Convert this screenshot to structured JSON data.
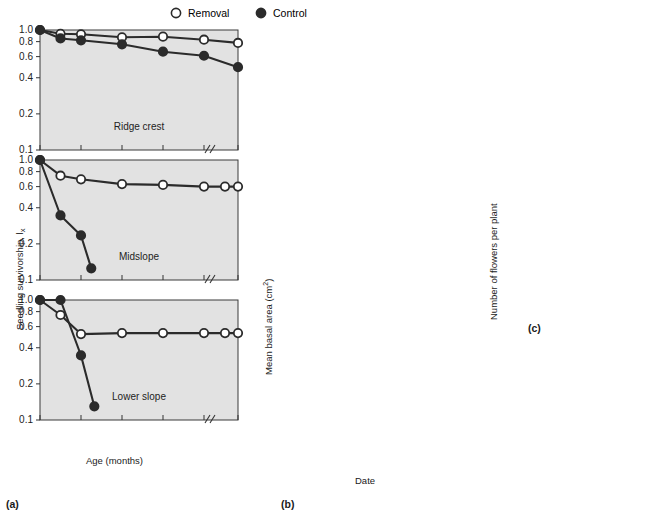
{
  "figure": {
    "legend": [
      {
        "symbol": "open-circle",
        "label": "Removal"
      },
      {
        "symbol": "filled-circle",
        "label": "Control"
      }
    ],
    "captions": {
      "a": "(a)",
      "b": "(b)",
      "c": "(c)"
    },
    "colors": {
      "panel_bg": "#e2e2e2",
      "line": "#2b2b2b",
      "open_fill": "#ffffff",
      "closed_fill": "#2b2b2b"
    }
  },
  "chart_data": [
    {
      "id": "a-ridge-crest",
      "type": "line",
      "title": "Ridge crest",
      "xlabel": "Age (months)",
      "ylabel": "Seedling survivorship, lx",
      "yscale": "log",
      "ylim": [
        0.1,
        1.0
      ],
      "yticks": [
        1.0,
        0.8,
        0.6,
        0.4,
        0.2,
        0.1
      ],
      "ytick_labels": [
        "1.0",
        "0.8",
        "0.6",
        "0.4",
        "0.2",
        "0.1"
      ],
      "xticks": [
        0,
        4,
        8,
        12,
        16,
        24
      ],
      "xtick_labels": [
        "0",
        "4",
        "8",
        "12",
        "16",
        "24"
      ],
      "x_axis_break_between": [
        16,
        24
      ],
      "secondary_xtick_labels": [
        "May 80",
        "Sep",
        "Jan 81",
        "May",
        "Sep",
        "May 82"
      ],
      "series": [
        {
          "name": "Removal",
          "symbol": "open-circle",
          "x": [
            0,
            2,
            4,
            8,
            12,
            16,
            24
          ],
          "values": [
            1.0,
            0.93,
            0.92,
            0.87,
            0.88,
            0.83,
            0.78
          ]
        },
        {
          "name": "Control",
          "symbol": "filled-circle",
          "x": [
            0,
            2,
            4,
            8,
            12,
            16,
            24
          ],
          "values": [
            1.0,
            0.85,
            0.82,
            0.76,
            0.66,
            0.61,
            0.49
          ]
        }
      ]
    },
    {
      "id": "a-midslope",
      "type": "line",
      "title": "Midslope",
      "yscale": "log",
      "ylim": [
        0.1,
        1.0
      ],
      "yticks": [
        1.0,
        0.8,
        0.6,
        0.4,
        0.2,
        0.1
      ],
      "ytick_labels": [
        "1.0",
        "0.8",
        "0.6",
        "0.4",
        "0.2",
        "0.1"
      ],
      "xticks": [
        0,
        4,
        8,
        12,
        16,
        24
      ],
      "series": [
        {
          "name": "Removal",
          "symbol": "open-circle",
          "x": [
            0,
            2,
            4,
            8,
            12,
            16,
            20,
            24
          ],
          "values": [
            1.0,
            0.74,
            0.69,
            0.63,
            0.62,
            0.6,
            0.6,
            0.6
          ]
        },
        {
          "name": "Control",
          "symbol": "filled-circle",
          "x": [
            0,
            2,
            4,
            5
          ],
          "values": [
            1.0,
            0.345,
            0.235,
            0.125
          ]
        }
      ]
    },
    {
      "id": "a-lower-slope",
      "type": "line",
      "title": "Lower slope",
      "yscale": "log",
      "ylim": [
        0.1,
        1.0
      ],
      "yticks": [
        1.0,
        0.8,
        0.6,
        0.4,
        0.2,
        0.1
      ],
      "ytick_labels": [
        "1.0",
        "0.8",
        "0.6",
        "0.4",
        "0.2",
        "0.1"
      ],
      "xticks": [
        0,
        4,
        8,
        12,
        16,
        24
      ],
      "series": [
        {
          "name": "Removal",
          "symbol": "open-circle",
          "x": [
            0,
            2,
            4,
            8,
            12,
            16,
            20,
            24
          ],
          "values": [
            1.0,
            0.75,
            0.52,
            0.53,
            0.53,
            0.53,
            0.53,
            0.53
          ]
        },
        {
          "name": "Control",
          "symbol": "filled-circle",
          "x": [
            0,
            2,
            4,
            5.3
          ],
          "values": [
            1.0,
            1.0,
            0.345,
            0.13
          ]
        }
      ]
    },
    {
      "id": "b-ridge-crest",
      "type": "line",
      "title": "Ridge crest",
      "xlabel": "Date",
      "ylabel": "Mean basal area (cm2)",
      "ylim": [
        22,
        45
      ],
      "yticks": [
        25,
        30,
        35,
        40,
        45
      ],
      "ytick_labels": [
        "25",
        "30",
        "35",
        "40",
        "45"
      ],
      "categories": [
        "Jan 80",
        "May",
        "Aug",
        "Oct",
        "Jan 81",
        "May",
        "Aug"
      ],
      "series": [
        {
          "name": "Removal",
          "symbol": "open-circle",
          "values": [
            30.5,
            36.2,
            41.2,
            37.1,
            36.2,
            37.6,
            43.0
          ]
        },
        {
          "name": "Control",
          "symbol": "filled-circle",
          "values": [
            33.1,
            36.2,
            39.0,
            34.2,
            32.0,
            29.4,
            31.6
          ]
        }
      ]
    },
    {
      "id": "b-midslope",
      "type": "line",
      "title": "Midslope",
      "ylim": [
        16,
        44
      ],
      "yticks": [
        20,
        25,
        30,
        35,
        40
      ],
      "ytick_labels": [
        "20",
        "25",
        "30",
        "35",
        "40"
      ],
      "categories": [
        "Jan 80",
        "May",
        "Aug",
        "Oct",
        "Jan 81",
        "May",
        "Aug"
      ],
      "series": [
        {
          "name": "Removal",
          "symbol": "open-circle",
          "values": [
            19.3,
            23.0,
            32.2,
            28.2,
            28.4,
            37.5,
            41.5
          ]
        },
        {
          "name": "Control",
          "symbol": "filled-circle",
          "values": [
            25.0,
            25.8,
            26.2,
            23.0,
            23.0,
            24.8,
            25.5
          ]
        }
      ]
    },
    {
      "id": "b-lower-slope",
      "type": "line",
      "title": "Lower slope",
      "ylim": [
        13,
        60
      ],
      "yticks": [
        15,
        20,
        25,
        30,
        35,
        40,
        45,
        50,
        55
      ],
      "ytick_labels": [
        "15",
        "20",
        "25",
        "30",
        "35",
        "40",
        "45",
        "50",
        "55"
      ],
      "categories": [
        "Jan 80",
        "May",
        "Aug",
        "Oct",
        "Jan 81",
        "May",
        "Aug"
      ],
      "series": [
        {
          "name": "Removal",
          "symbol": "open-circle",
          "values": [
            14.2,
            20.6,
            31.2,
            36.4,
            35.4,
            42.0,
            58.0
          ]
        },
        {
          "name": "Control",
          "symbol": "filled-circle",
          "values": [
            15.8,
            20.6,
            26.4,
            25.6,
            25.2,
            23.2,
            28.2
          ]
        }
      ]
    },
    {
      "id": "c-flowers",
      "type": "bar",
      "ylabel": "Number of flowers per plant",
      "ylim": [
        0,
        75
      ],
      "yticks": [
        0,
        10,
        20,
        30,
        40,
        50,
        60,
        70
      ],
      "ytick_labels": [
        "0",
        "10",
        "20",
        "30",
        "40",
        "50",
        "60",
        "70"
      ],
      "categories": [
        "Ridge crest",
        "Mid- slope",
        "Lower slope"
      ],
      "category_lines": [
        [
          "Ridge",
          "crest"
        ],
        [
          "Mid-",
          "slope"
        ],
        [
          "Lower",
          "slope"
        ]
      ],
      "legend": [
        "Removal",
        "Control"
      ],
      "series": [
        {
          "name": "Control",
          "fill": "#2b2b2b",
          "values": [
            1.5,
            4.2,
            35.8
          ]
        },
        {
          "name": "Removal",
          "fill": "#ffffff",
          "values": [
            13.3,
            28.8,
            59.0
          ]
        }
      ]
    }
  ],
  "axis_text": {
    "a_ylabel": "Seedling survivorship, l",
    "a_ylabel_sub": "x",
    "a_xlabel": "Age (months)",
    "b_ylabel": "Mean basal area (cm",
    "b_ylabel_sup": "2",
    "b_ylabel_end": ")",
    "b_xlabel": "Date",
    "c_ylabel": "Number of flowers per plant"
  },
  "a_date_labels": [
    {
      "top": "May",
      "bottom": "80"
    },
    {
      "top": "Sep",
      "bottom": ""
    },
    {
      "top": "Jan",
      "bottom": "81"
    },
    {
      "top": "May",
      "bottom": ""
    },
    {
      "top": "Sep",
      "bottom": ""
    },
    {
      "top": "May",
      "bottom": "82"
    }
  ],
  "b_date_labels": [
    {
      "top": "Jan",
      "bottom": "80"
    },
    {
      "top": "May",
      "bottom": ""
    },
    {
      "top": "Aug",
      "bottom": ""
    },
    {
      "top": "Oct",
      "bottom": ""
    },
    {
      "top": "Jan",
      "bottom": "81"
    },
    {
      "top": "May",
      "bottom": ""
    },
    {
      "top": "Aug",
      "bottom": ""
    }
  ]
}
